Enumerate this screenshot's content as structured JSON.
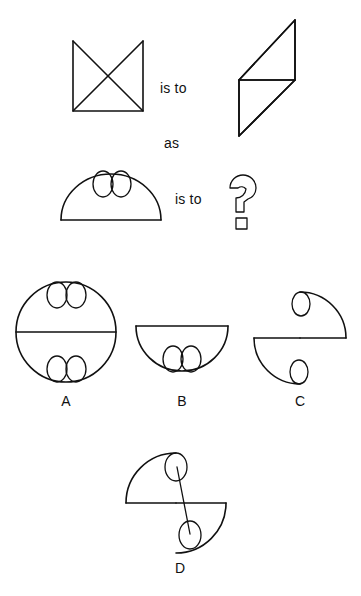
{
  "puzzle": {
    "type": "visual-analogy",
    "relation_words": {
      "is_to_1": "is to",
      "as": "as",
      "is_to_2": "is to"
    },
    "prompt_row_1": {
      "left_figure": {
        "name": "open-square-with-x-diagonals",
        "description": "Square missing its top edge with both diagonals drawn forming an X"
      },
      "right_figure": {
        "name": "parallelogram-with-midline",
        "description": "Slanted parallelogram with a horizontal line across the middle"
      }
    },
    "prompt_row_2": {
      "left_figure": {
        "name": "dome-with-two-ellipses",
        "description": "Semicircular dome on a flat base with two small vertical ellipses at the top interior"
      },
      "right_figure": {
        "name": "question-mark",
        "description": "Outlined question mark glyph marking the missing answer"
      }
    },
    "options": [
      {
        "id": "A",
        "label": "A",
        "name": "option-a-circle-with-diameter-and-four-ellipses",
        "description": "Full circle with horizontal diameter; two ellipses at top interior and two at bottom interior"
      },
      {
        "id": "B",
        "label": "B",
        "name": "option-b-bowl-with-two-ellipses",
        "description": "Inverted dome (bowl) with flat top and two ellipses at the bottom interior"
      },
      {
        "id": "C",
        "label": "C",
        "name": "option-c-offset-quarter-arcs-with-ellipses",
        "description": "Upper-right quarter arc with one ellipse and lower-left quarter arc with one ellipse, split by a horizontal line"
      },
      {
        "id": "D",
        "label": "D",
        "name": "option-d-pinwheel-arcs-with-linked-ellipses",
        "description": "Upper-left quarter arc and lower-right quarter arc with two ellipses joined by a diagonal line"
      }
    ],
    "colors": {
      "ink": "#111111",
      "background": "#ffffff"
    }
  }
}
